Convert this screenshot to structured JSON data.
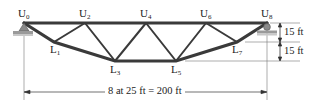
{
  "diagram": {
    "type": "truss",
    "nodes": {
      "upper": [
        {
          "name": "U",
          "sub": "0"
        },
        {
          "name": "U",
          "sub": "2"
        },
        {
          "name": "U",
          "sub": "4"
        },
        {
          "name": "U",
          "sub": "6"
        },
        {
          "name": "U",
          "sub": "8"
        }
      ],
      "lower": [
        {
          "name": "L",
          "sub": "1"
        },
        {
          "name": "L",
          "sub": "3"
        },
        {
          "name": "L",
          "sub": "5"
        },
        {
          "name": "L",
          "sub": "7"
        }
      ]
    },
    "dimensions": {
      "span": "8 at 25 ft = 200 ft",
      "height_upper": "15 ft",
      "height_lower": "15 ft"
    },
    "supports": {
      "left": "pin",
      "right": "roller"
    },
    "colors": {
      "member": "#3a3a3a",
      "ground": "#8a8a8a",
      "line": "#555555"
    }
  }
}
